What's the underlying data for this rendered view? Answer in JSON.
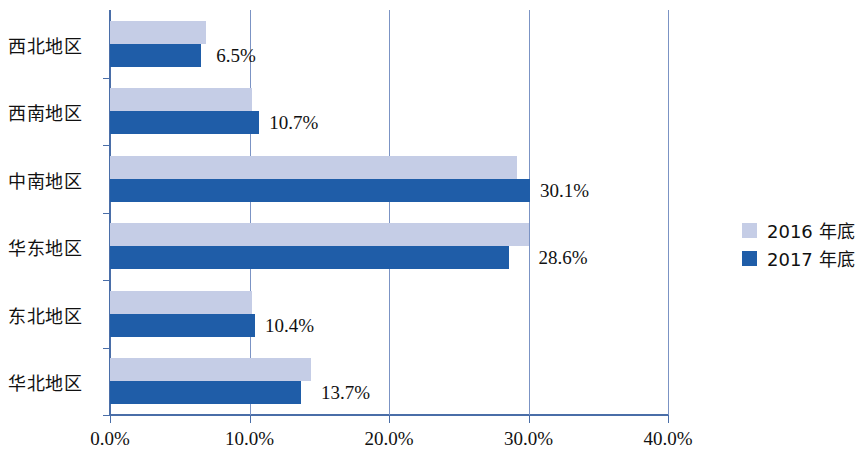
{
  "chart_data": {
    "type": "bar",
    "orientation": "horizontal",
    "title": "",
    "xlabel": "",
    "ylabel": "",
    "xlim": [
      0,
      40
    ],
    "xticks": [
      0,
      10,
      20,
      30,
      40
    ],
    "xtick_labels": [
      "0.0%",
      "10.0%",
      "20.0%",
      "30.0%",
      "40.0%"
    ],
    "grid": true,
    "grid_axis": "x",
    "legend_position": "right",
    "categories": [
      "西北地区",
      "西南地区",
      "中南地区",
      "华东地区",
      "东北地区",
      "华北地区"
    ],
    "series": [
      {
        "name": "2016 年底",
        "color": "#c5cde6",
        "values": [
          6.9,
          10.2,
          29.2,
          30.0,
          10.2,
          14.4
        ],
        "labels_shown": false
      },
      {
        "name": "2017 年底",
        "color": "#1f5da8",
        "values": [
          6.5,
          10.7,
          30.1,
          28.6,
          10.4,
          13.7
        ],
        "labels_shown": true,
        "value_labels": [
          "6.5%",
          "10.7%",
          "30.1%",
          "28.6%",
          "10.4%",
          "13.7%"
        ]
      }
    ]
  },
  "axis": {
    "line_color": "#4a6ea8",
    "grid_color": "#7b93c4"
  },
  "legend": {
    "entries": [
      {
        "label": "2016 年底",
        "color": "#c5cde6"
      },
      {
        "label": "2017 年底",
        "color": "#1f5da8"
      }
    ]
  }
}
